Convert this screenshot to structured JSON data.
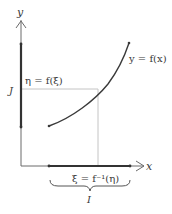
{
  "diagram": {
    "type": "inverse-function-illustration",
    "axes": {
      "x_label": "x",
      "y_label": "y"
    },
    "curve_label": "y = f(x)",
    "eta_label": "η = f(ξ)",
    "xi_label": "ξ = f⁻¹(η)",
    "interval_y_label": "J",
    "interval_x_label": "I",
    "colors": {
      "axis": "#5a5a5a",
      "curve": "#3a3a3a",
      "guide": "#bdbdbd",
      "interval": "#333333"
    }
  }
}
